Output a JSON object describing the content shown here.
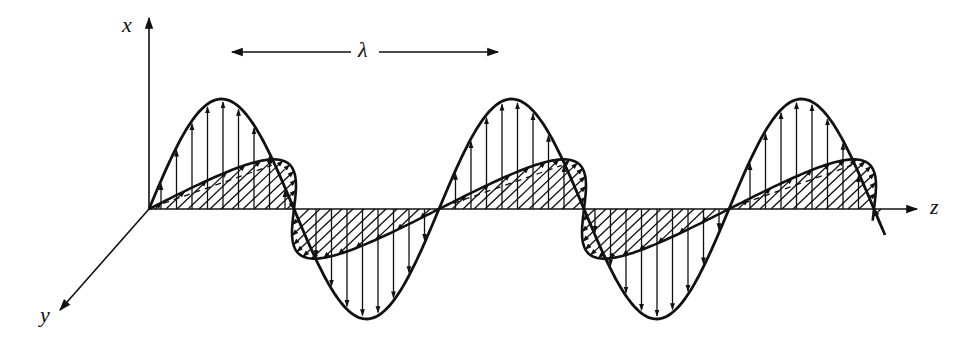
{
  "diagram": {
    "labels": {
      "x_axis": "x",
      "y_axis": "y",
      "z_axis": "z",
      "wavelength": "λ"
    },
    "colors": {
      "stroke": "#111111",
      "background": "#ffffff"
    },
    "geometry": {
      "origin": [
        149,
        209
      ],
      "z_axis_end": [
        917,
        209
      ],
      "x_axis_end": [
        149,
        18
      ],
      "y_axis_end": [
        60,
        310
      ],
      "wavelength_px": 290,
      "e_amplitude_px": 110,
      "b_depth_dx": 0.42,
      "b_depth_dy": 0.62,
      "b_amplitude_px": 95,
      "z_start": 149,
      "z_end": 885,
      "lambda_arrow": {
        "x1": 232,
        "x2": 498,
        "y": 52,
        "label_x": 365
      }
    },
    "fields": [
      {
        "name": "electric-field",
        "axis": "x",
        "style": "vertical-arrows"
      },
      {
        "name": "magnetic-field",
        "axis": "y",
        "style": "hatched-diagonal-arrows"
      }
    ]
  }
}
